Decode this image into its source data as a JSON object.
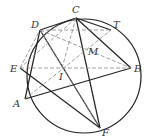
{
  "diagram": {
    "circle": {
      "cx": 84,
      "cy": 76,
      "r": 57
    },
    "points": {
      "C": {
        "x": 76,
        "y": 18,
        "label": "C",
        "lx": 72,
        "ly": 13
      },
      "D": {
        "x": 40,
        "y": 30,
        "label": "D",
        "lx": 31,
        "ly": 27
      },
      "T": {
        "x": 111,
        "y": 30,
        "label": "T",
        "lx": 113,
        "ly": 27
      },
      "M": {
        "x": 93,
        "y": 50,
        "label": "M",
        "lx": 88,
        "ly": 54
      },
      "E": {
        "x": 20,
        "y": 68,
        "label": "E",
        "lx": 11,
        "ly": 72
      },
      "B": {
        "x": 131,
        "y": 68,
        "label": "B",
        "lx": 134,
        "ly": 72
      },
      "I": {
        "x": 62,
        "y": 68,
        "label": "I",
        "lx": 58,
        "ly": 80
      },
      "A": {
        "x": 25,
        "y": 99,
        "label": "A",
        "lx": 14,
        "ly": 107
      },
      "F": {
        "x": 100,
        "y": 128,
        "label": "F",
        "lx": 101,
        "ly": 136
      }
    },
    "labels": [
      "A",
      "B",
      "C",
      "D",
      "E",
      "F",
      "I",
      "M",
      "T"
    ]
  }
}
